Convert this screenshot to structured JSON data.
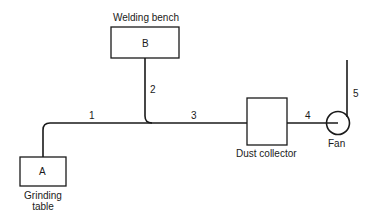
{
  "diagram": {
    "nodes": {
      "welding_bench": {
        "letter": "B",
        "label": "Welding bench"
      },
      "grinding_table": {
        "letter": "A",
        "label_line1": "Grinding",
        "label_line2": "table"
      },
      "dust_collector": {
        "label": "Dust collector"
      },
      "fan": {
        "label": "Fan"
      }
    },
    "duct_segments": [
      "1",
      "2",
      "3",
      "4",
      "5"
    ],
    "colors": {
      "ink": "#1a1a1a",
      "background": "#ffffff"
    }
  }
}
